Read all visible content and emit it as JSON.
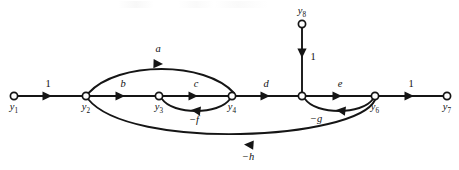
{
  "figure": {
    "kind": "signal-flow-graph",
    "background_color": "#ffffff",
    "stroke_color": "#151515",
    "text_color": "#111111"
  },
  "nodes": [
    {
      "id": "y1",
      "label": "y",
      "sub": "1",
      "x": 14,
      "y": 96,
      "label_x": 14,
      "label_y": 110,
      "r": 3.6
    },
    {
      "id": "y2",
      "label": "y",
      "sub": "2",
      "x": 86,
      "y": 96,
      "label_x": 86,
      "label_y": 110,
      "r": 3.6
    },
    {
      "id": "y3",
      "label": "y",
      "sub": "3",
      "x": 159,
      "y": 96,
      "label_x": 159,
      "label_y": 110,
      "r": 3.6
    },
    {
      "id": "y4",
      "label": "y",
      "sub": "4",
      "x": 232,
      "y": 96,
      "label_x": 232,
      "label_y": 110,
      "r": 3.6
    },
    {
      "id": "y5",
      "label": "",
      "sub": "",
      "x": 302,
      "y": 96,
      "label_x": 302,
      "label_y": 110,
      "r": 3.6
    },
    {
      "id": "y6",
      "label": "y",
      "sub": "6",
      "x": 375,
      "y": 96,
      "label_x": 375,
      "label_y": 110,
      "r": 3.6
    },
    {
      "id": "y7",
      "label": "y",
      "sub": "7",
      "x": 447,
      "y": 96,
      "label_x": 447,
      "label_y": 110,
      "r": 3.6
    },
    {
      "id": "y8",
      "label": "y",
      "sub": "8",
      "x": 302,
      "y": 24,
      "label_x": 302,
      "label_y": 14,
      "r": 3.6
    }
  ],
  "edges": [
    {
      "id": "e-y1-y2",
      "from": "y1",
      "to": "y2",
      "label": "1",
      "label_x": 48,
      "label_y": 87,
      "italic": false,
      "path": "M 18,96 L 82,96",
      "arrow": {
        "x": 52,
        "y": 96,
        "angle": 0
      }
    },
    {
      "id": "e-y2-y4-a",
      "from": "y2",
      "to": "y4",
      "label": "a",
      "label_x": 158,
      "label_y": 52,
      "italic": true,
      "path": "M 88.6,93 C 118,61 205,61 234,93",
      "arrow": {
        "x": 163,
        "y": 64,
        "angle": 2
      }
    },
    {
      "id": "e-y2-y3-b",
      "from": "y2",
      "to": "y3",
      "label": "b",
      "label_x": 123,
      "label_y": 87,
      "italic": true,
      "path": "M 90,96 L 155,96",
      "arrow": {
        "x": 125,
        "y": 96,
        "angle": 0
      }
    },
    {
      "id": "e-y3-y4-c",
      "from": "y3",
      "to": "y4",
      "label": "c",
      "label_x": 196,
      "label_y": 87,
      "italic": true,
      "path": "M 163,96 L 228,96",
      "arrow": {
        "x": 198,
        "y": 96,
        "angle": 0
      }
    },
    {
      "id": "e-y4-y3-nf",
      "from": "y4",
      "to": "y3",
      "label": "−f",
      "label_x": 194,
      "label_y": 123,
      "italic": true,
      "path": "M 230,99 C 219,115 173,115 162,99",
      "arrow": {
        "x": 191,
        "y": 110,
        "angle": 187
      }
    },
    {
      "id": "e-y4-y5-d",
      "from": "y4",
      "to": "y5",
      "label": "d",
      "label_x": 266,
      "label_y": 87,
      "italic": true,
      "path": "M 236,96 L 298,96",
      "arrow": {
        "x": 270,
        "y": 96,
        "angle": 0
      }
    },
    {
      "id": "e-y8-y5",
      "from": "y8",
      "to": "y5",
      "label": "1",
      "label_x": 313,
      "label_y": 60,
      "italic": false,
      "path": "M 302,28 L 302,93",
      "arrow": {
        "x": 302,
        "y": 58,
        "angle": 90
      }
    },
    {
      "id": "e-y5-y6-e",
      "from": "y5",
      "to": "y6",
      "label": "e",
      "label_x": 340,
      "label_y": 87,
      "italic": true,
      "path": "M 306,96 L 371,96",
      "arrow": {
        "x": 342,
        "y": 96,
        "angle": 0
      }
    },
    {
      "id": "e-y6-y5-ng",
      "from": "y6",
      "to": "y5",
      "label": "−g",
      "label_x": 316,
      "label_y": 122,
      "italic": true,
      "path": "M 373,99 C 362,115 316,115 305,99",
      "arrow": {
        "x": 336,
        "y": 110,
        "angle": 187
      }
    },
    {
      "id": "e-y6-y7",
      "from": "y6",
      "to": "y7",
      "label": "1",
      "label_x": 411,
      "label_y": 87,
      "italic": false,
      "path": "M 379,96 L 443,96",
      "arrow": {
        "x": 414,
        "y": 96,
        "angle": 0
      }
    },
    {
      "id": "e-y6-y2-nh",
      "from": "y6",
      "to": "y2",
      "label": "−h",
      "label_x": 248,
      "label_y": 160,
      "italic": true,
      "path": "M 375,100 C 356,140 130,151 88,99",
      "arrow": {
        "x": 244,
        "y": 144.5,
        "angle": 184
      }
    }
  ],
  "labels": {
    "subscript_font_size": 7.2,
    "node_font_size": 10.5,
    "edge_font_size": 10.5
  }
}
